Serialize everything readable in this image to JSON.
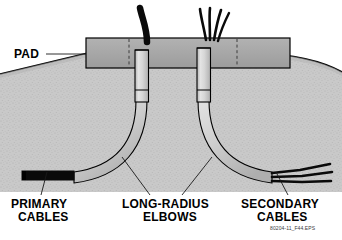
{
  "figure": {
    "reference_code": "80204-11_F44.EPS",
    "background_color": "#ffffff"
  },
  "callouts": {
    "pad": {
      "label": "PAD",
      "leader": "horizontal-line-right"
    },
    "primary": {
      "line1": "PRIMARY",
      "line2": "CABLES",
      "leader": "diagonal-up-right"
    },
    "elbows": {
      "line1": "LONG-RADIUS",
      "line2": "ELBOWS",
      "leader": "two-diagonal-lines-up"
    },
    "secondary": {
      "line1": "SECONDARY",
      "line2": "CABLES",
      "leader": "diagonal-up-left"
    }
  },
  "elements": {
    "pad_slab": {
      "name": "concrete-pad",
      "fill": "#a8a8a8",
      "stroke": "#000000"
    },
    "ground": {
      "name": "soil-cross-section",
      "fill": "#c4c4c4",
      "stroke": "#000000",
      "texture": "stippled"
    },
    "conduit": {
      "name": "conduit-elbow",
      "fill": "#d2d2d2",
      "stroke": "#000000"
    },
    "cables_primary": {
      "name": "primary-cable",
      "color": "#000000",
      "count": 1
    },
    "cables_secondary": {
      "name": "secondary-cable",
      "color": "#000000",
      "count": 4
    },
    "dashed_markers": {
      "name": "pad-edge-dashed-line",
      "color": "#333333"
    }
  }
}
